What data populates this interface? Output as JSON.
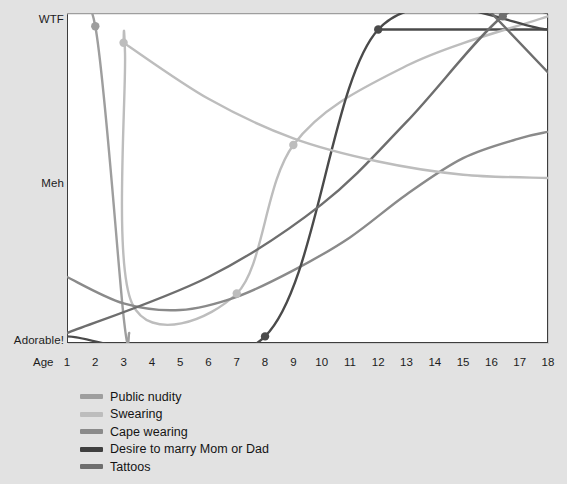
{
  "chart_data": {
    "type": "line",
    "title": "",
    "xlabel": "Age",
    "ylabel": "",
    "x_ticks": [
      1,
      2,
      3,
      4,
      5,
      6,
      7,
      8,
      9,
      10,
      11,
      12,
      13,
      14,
      15,
      16,
      17,
      18
    ],
    "xlim": [
      1,
      18
    ],
    "y_ticks": [
      "Adorable!",
      "Meh",
      "WTF"
    ],
    "y_tick_values": [
      0,
      50,
      100
    ],
    "ylim": [
      0,
      100
    ],
    "grid": false,
    "legend_position": "below-left",
    "colors": {
      "public_nudity": "#9e9e9e",
      "swearing": "#bdbdbd",
      "cape_wearing": "#8a8a8a",
      "desire_to_marry": "#4a4a4a",
      "tattoos": "#6e6e6e"
    },
    "series": [
      {
        "name": "Public nudity",
        "color": "#9e9e9e",
        "marker_points": [
          {
            "x": 2,
            "y": 96
          }
        ],
        "points": [
          {
            "x": 1,
            "y": 100
          },
          {
            "x": 2,
            "y": 96
          },
          {
            "x": 3,
            "y": 8
          },
          {
            "x": 3.2,
            "y": 3
          }
        ]
      },
      {
        "name": "Swearing",
        "color": "#bdbdbd",
        "marker_points": [
          {
            "x": 3,
            "y": 91
          },
          {
            "x": 7,
            "y": 15
          },
          {
            "x": 9,
            "y": 60
          }
        ],
        "points": [
          {
            "x": 3,
            "y": 91
          },
          {
            "x": 3.05,
            "y": 88
          },
          {
            "x": 3.3,
            "y": 12
          },
          {
            "x": 7,
            "y": 15
          },
          {
            "x": 9,
            "y": 60
          },
          {
            "x": 13,
            "y": 84
          },
          {
            "x": 18,
            "y": 99
          }
        ]
      },
      {
        "name": "Cape wearing",
        "color": "#8a8a8a",
        "marker_points": [],
        "points": [
          {
            "x": 1,
            "y": 20
          },
          {
            "x": 3,
            "y": 12
          },
          {
            "x": 5,
            "y": 10
          },
          {
            "x": 7,
            "y": 14
          },
          {
            "x": 9,
            "y": 22
          },
          {
            "x": 11,
            "y": 32
          },
          {
            "x": 13,
            "y": 45
          },
          {
            "x": 15,
            "y": 56
          },
          {
            "x": 17,
            "y": 62
          },
          {
            "x": 18,
            "y": 64
          }
        ]
      },
      {
        "name": "Desire to marry Mom or Dad",
        "color": "#4a4a4a",
        "marker_points": [
          {
            "x": 8,
            "y": 2
          },
          {
            "x": 12,
            "y": 95
          }
        ],
        "points": [
          {
            "x": 1,
            "y": 2
          },
          {
            "x": 8,
            "y": 2
          },
          {
            "x": 12,
            "y": 95
          },
          {
            "x": 18,
            "y": 95
          }
        ]
      },
      {
        "name": "Tattoos",
        "color": "#6e6e6e",
        "marker_points": [
          {
            "x": 16.4,
            "y": 99
          }
        ],
        "points": [
          {
            "x": 1,
            "y": 3
          },
          {
            "x": 6,
            "y": 20
          },
          {
            "x": 10,
            "y": 42
          },
          {
            "x": 13,
            "y": 67
          },
          {
            "x": 16.4,
            "y": 99
          },
          {
            "x": 18,
            "y": 100
          }
        ]
      },
      {
        "name": "Swearing-decline",
        "color": "#bdbdbd",
        "marker_points": [],
        "points": [
          {
            "x": 3,
            "y": 91
          },
          {
            "x": 6,
            "y": 74
          },
          {
            "x": 9,
            "y": 62
          },
          {
            "x": 12,
            "y": 55
          },
          {
            "x": 15,
            "y": 51
          },
          {
            "x": 18,
            "y": 50
          }
        ]
      }
    ],
    "top_rules": [
      {
        "name": "public-nudity-top-rule",
        "color": "#9e9e9e",
        "x_start": 1,
        "x_end": 18,
        "y": 100
      },
      {
        "name": "desire-top-rule",
        "color": "#4a4a4a",
        "x_start": 12,
        "x_end": 18,
        "y": 95
      }
    ],
    "crossing_lines": [
      {
        "name": "descending-diagonal",
        "color": "#6e6e6e",
        "x_start": 16,
        "y_start": 100,
        "x_end": 18,
        "y_end": 82
      }
    ]
  },
  "axis": {
    "age_label": "Age",
    "y_labels": {
      "top": "WTF",
      "middle": "Meh",
      "bottom": "Adorable!"
    },
    "x_tick_labels": [
      "1",
      "2",
      "3",
      "4",
      "5",
      "6",
      "7",
      "8",
      "9",
      "10",
      "11",
      "12",
      "13",
      "14",
      "15",
      "16",
      "17",
      "18"
    ]
  },
  "legend": {
    "items": [
      {
        "label": "Public nudity",
        "color": "#9e9e9e"
      },
      {
        "label": "Swearing",
        "color": "#bdbdbd"
      },
      {
        "label": "Cape wearing",
        "color": "#8a8a8a"
      },
      {
        "label": "Desire to marry Mom or Dad",
        "color": "#3f3f3f"
      },
      {
        "label": "Tattoos",
        "color": "#6e6e6e"
      }
    ]
  }
}
